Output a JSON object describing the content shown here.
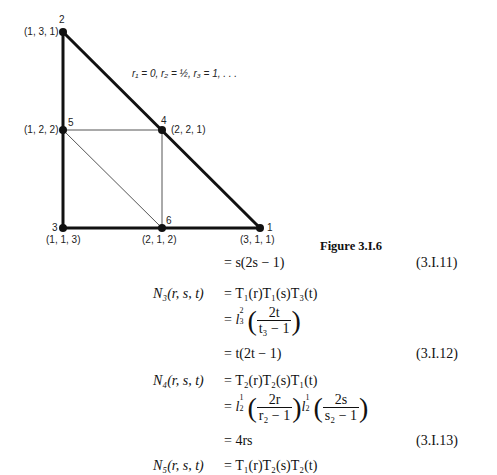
{
  "figure": {
    "caption": "Figure 3.I.6",
    "annotation": "r₁ = 0, r₂ = ½, r₃ = 1, . . .",
    "nodes": [
      {
        "id": "1",
        "coords": "(3, 1, 1)"
      },
      {
        "id": "2",
        "coords": "(1, 3, 1)"
      },
      {
        "id": "3",
        "coords": "(1, 1, 3)"
      },
      {
        "id": "4",
        "coords": "(2, 2, 1)"
      },
      {
        "id": "5",
        "coords": "(1, 2, 2)"
      },
      {
        "id": "6",
        "coords": "(2, 1, 2)"
      }
    ]
  },
  "equations": {
    "eq11": {
      "rhs": "= s(2s − 1)",
      "number": "(3.I.11)"
    },
    "n3": {
      "lhs": "N₃(r, s, t)",
      "line1": "= T₁(r)T₁(s)T₃(t)",
      "frac_num": "2t",
      "frac_den": "t₃ − 1",
      "result": "= t(2t − 1)",
      "number": "(3.I.12)"
    },
    "n4": {
      "lhs": "N₄(r, s, t)",
      "line1": "= T₂(r)T₂(s)T₁(t)",
      "frac1_num": "2r",
      "frac1_den": "r₂ − 1",
      "frac2_num": "2s",
      "frac2_den": "s₂ − 1",
      "result": "= 4rs",
      "number": "(3.I.13)"
    },
    "n5": {
      "lhs": "N₅(r, s, t)",
      "line1": "= T₁(r)T₂(s)T₂(t)"
    }
  }
}
